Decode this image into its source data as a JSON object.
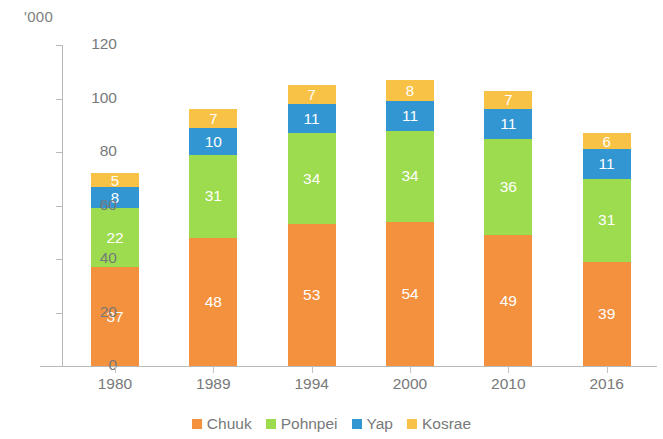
{
  "chart_data": {
    "type": "bar",
    "subtype": "stacked-vertical",
    "title": "",
    "subtitle": "",
    "unit_label": "'000",
    "xlabel": "",
    "ylabel": "",
    "ylim": [
      0,
      120
    ],
    "yticks": [
      0,
      20,
      40,
      60,
      80,
      100,
      120
    ],
    "ytick_labels": [
      "0",
      "20",
      "40",
      "60",
      "80",
      "100",
      "120"
    ],
    "grid": false,
    "legend_position": "bottom-center",
    "categories": [
      "1980",
      "1989",
      "1994",
      "2000",
      "2010",
      "2016"
    ],
    "series": [
      {
        "name": "Chuuk",
        "color": "#F3913F",
        "values": [
          37,
          48,
          53,
          54,
          49,
          39
        ]
      },
      {
        "name": "Pohnpei",
        "color": "#9DDB4F",
        "values": [
          22,
          31,
          34,
          34,
          36,
          31
        ]
      },
      {
        "name": "Yap",
        "color": "#3296D2",
        "values": [
          8,
          10,
          11,
          11,
          11,
          11
        ]
      },
      {
        "name": "Kosrae",
        "color": "#F7C246",
        "values": [
          5,
          7,
          7,
          8,
          7,
          6
        ]
      }
    ],
    "totals": [
      72,
      96,
      105,
      107,
      103,
      87
    ],
    "data_labels": [
      {
        "category": "1980",
        "Chuuk": "37",
        "Pohnpei": "22",
        "Yap": "8",
        "Kosrae": "5"
      },
      {
        "category": "1989",
        "Chuuk": "48",
        "Pohnpei": "31",
        "Yap": "10",
        "Kosrae": "7"
      },
      {
        "category": "1994",
        "Chuuk": "53",
        "Pohnpei": "34",
        "Yap": "11",
        "Kosrae": "7"
      },
      {
        "category": "2000",
        "Chuuk": "54",
        "Pohnpei": "34",
        "Yap": "11",
        "Kosrae": "8"
      },
      {
        "category": "2010",
        "Chuuk": "49",
        "Pohnpei": "36",
        "Yap": "11",
        "Kosrae": "7"
      },
      {
        "category": "2016",
        "Chuuk": "39",
        "Pohnpei": "31",
        "Yap": "11",
        "Kosrae": "6"
      }
    ]
  },
  "legend": {
    "items": [
      {
        "label": "Chuuk",
        "color": "#F3913F"
      },
      {
        "label": "Pohnpei",
        "color": "#9DDB4F"
      },
      {
        "label": "Yap",
        "color": "#3296D2"
      },
      {
        "label": "Kosrae",
        "color": "#F7C246"
      }
    ]
  },
  "axis": {
    "line_color": "#b9b9b9",
    "label_color": "#77797a"
  }
}
